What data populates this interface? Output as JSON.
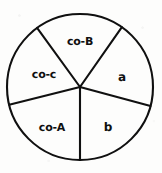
{
  "figure": {
    "width": 162,
    "height": 173,
    "background_color": "#fdfdfc",
    "stroke_color": "#101010",
    "text_color": "#101010"
  },
  "chart_data": {
    "type": "pie",
    "title": "",
    "subtitle": "",
    "xlabel": "",
    "ylabel": "",
    "legend_position": "none",
    "grid": false,
    "center": {
      "x": 80,
      "y": 87
    },
    "radius": 73,
    "note": "Angles measured clockwise from 12 o'clock. Sector boundaries at 35, 105, 180, 256 and 324 degrees.",
    "boundary_angles_deg": [
      35,
      105,
      180,
      256,
      324
    ],
    "categories": [
      "co-B",
      "a",
      "b",
      "co-A",
      "co-c"
    ],
    "values": [
      71,
      70,
      75,
      76,
      68
    ],
    "slices": [
      {
        "label": "co-B",
        "start_angle_deg": 324,
        "end_angle_deg": 35,
        "sweep_deg": 71,
        "fill": "none",
        "label_x": 80,
        "label_y": 41
      },
      {
        "label": "a",
        "start_angle_deg": 35,
        "end_angle_deg": 105,
        "sweep_deg": 70,
        "fill": "none",
        "label_x": 122,
        "label_y": 77
      },
      {
        "label": "b",
        "start_angle_deg": 105,
        "end_angle_deg": 180,
        "sweep_deg": 75,
        "fill": "none",
        "label_x": 108,
        "label_y": 127
      },
      {
        "label": "co-A",
        "start_angle_deg": 180,
        "end_angle_deg": 256,
        "sweep_deg": 76,
        "fill": "none",
        "label_x": 52,
        "label_y": 127
      },
      {
        "label": "co-c",
        "start_angle_deg": 256,
        "end_angle_deg": 324,
        "sweep_deg": 68,
        "fill": "none",
        "label_x": 44,
        "label_y": 74
      }
    ]
  }
}
